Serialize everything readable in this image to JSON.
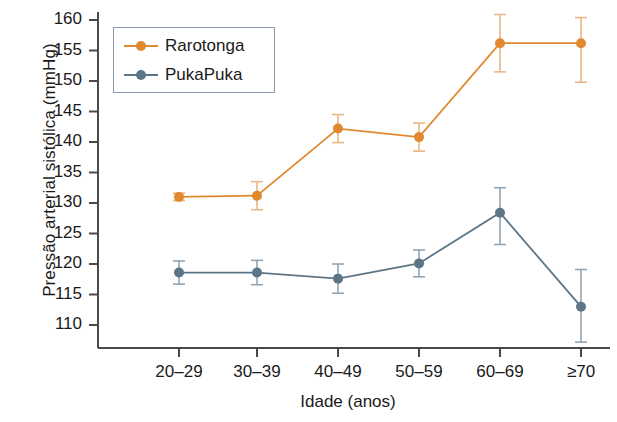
{
  "chart_data": {
    "type": "line",
    "title": "",
    "xlabel": "Idade (anos)",
    "ylabel": "Pressão arterial sistólica (mmHg)",
    "categories": [
      "20–29",
      "30–39",
      "40–49",
      "50–59",
      "60–69",
      "≥70"
    ],
    "ylim": [
      106,
      161.5
    ],
    "yticks": [
      110,
      115,
      120,
      125,
      130,
      135,
      140,
      145,
      150,
      155,
      160
    ],
    "ytick_labels": [
      "110",
      "115",
      "120",
      "125",
      "130",
      "135",
      "140",
      "145",
      "150",
      "155",
      "160"
    ],
    "grid": false,
    "legend_position": "top-left",
    "error_bars": true,
    "series": [
      {
        "name": "Rarotonga",
        "color": "#e0892f",
        "values": [
          131.0,
          131.2,
          142.2,
          140.8,
          156.2,
          156.2
        ],
        "err_low": [
          130.4,
          128.9,
          139.9,
          138.5,
          151.5,
          149.8
        ],
        "err_high": [
          131.6,
          133.5,
          144.5,
          143.1,
          160.9,
          160.4
        ]
      },
      {
        "name": "PukaPuka",
        "color": "#5d7687",
        "values": [
          118.6,
          118.6,
          117.6,
          120.1,
          128.4,
          113.0
        ],
        "err_low": [
          116.7,
          116.6,
          115.2,
          117.9,
          123.2,
          107.2
        ],
        "err_high": [
          120.5,
          120.6,
          120.0,
          122.3,
          132.5,
          119.1
        ]
      }
    ]
  },
  "legend": {
    "items": [
      {
        "label": "Rarotonga",
        "color": "#e0892f"
      },
      {
        "label": "PukaPuka",
        "color": "#5d7687"
      }
    ]
  },
  "axis": {
    "line_color": "#4a4a4a"
  }
}
